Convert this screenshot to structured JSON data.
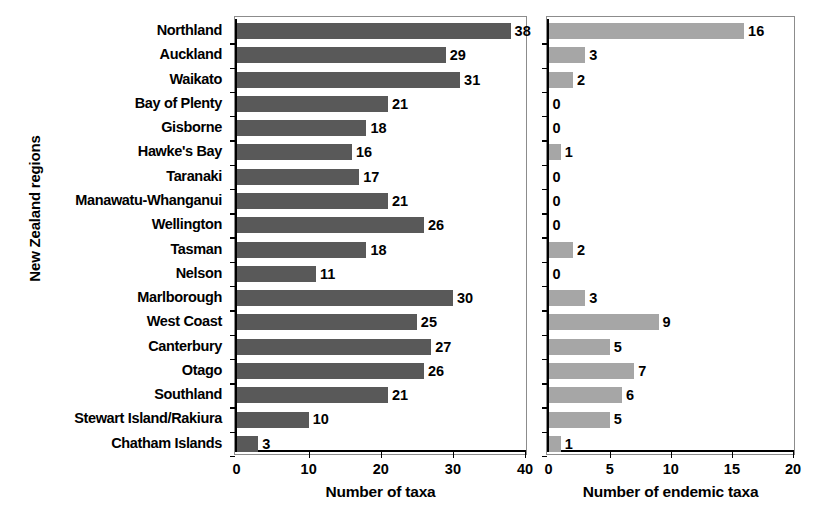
{
  "chart_data": {
    "type": "bar",
    "orientation": "horizontal",
    "title": "",
    "ylabel": "New Zealand regions",
    "grid": false,
    "legend": null,
    "categories": [
      "Northland",
      "Auckland",
      "Waikato",
      "Bay of Plenty",
      "Gisborne",
      "Hawke's Bay",
      "Taranaki",
      "Manawatu-Whanganui",
      "Wellington",
      "Tasman",
      "Nelson",
      "Marlborough",
      "West Coast",
      "Canterbury",
      "Otago",
      "Southland",
      "Stewart Island/Rakiura",
      "Chatham Islands"
    ],
    "panels": [
      {
        "name": "taxa",
        "xlabel": "Number of taxa",
        "xlim": [
          0,
          40
        ],
        "xticks": [
          0,
          10,
          20,
          30,
          40
        ],
        "xtick_labels": [
          "0",
          "10",
          "20",
          "30",
          "40"
        ],
        "bar_color": "#595959",
        "values": [
          38,
          29,
          31,
          21,
          18,
          16,
          17,
          21,
          26,
          18,
          11,
          30,
          25,
          27,
          26,
          21,
          10,
          3
        ],
        "value_labels": [
          "38",
          "29",
          "31",
          "21",
          "18",
          "16",
          "17",
          "21",
          "26",
          "18",
          "11",
          "30",
          "25",
          "27",
          "26",
          "21",
          "10",
          "3"
        ]
      },
      {
        "name": "endemic",
        "xlabel": "Number of endemic taxa",
        "xlim": [
          0,
          20
        ],
        "xticks": [
          0,
          5,
          10,
          15,
          20
        ],
        "xtick_labels": [
          "0",
          "5",
          "10",
          "15",
          "20"
        ],
        "bar_color": "#a6a6a6",
        "values": [
          16,
          3,
          2,
          0,
          0,
          1,
          0,
          0,
          0,
          2,
          0,
          3,
          9,
          5,
          7,
          6,
          5,
          1
        ],
        "value_labels": [
          "16",
          "3",
          "2",
          "0",
          "0",
          "1",
          "0",
          "0",
          "0",
          "2",
          "0",
          "3",
          "9",
          "5",
          "7",
          "6",
          "5",
          "1"
        ]
      }
    ]
  }
}
